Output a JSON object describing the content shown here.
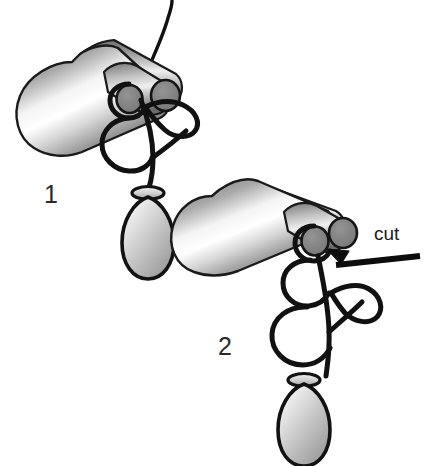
{
  "figure": {
    "background_color": "#ffffff",
    "width": 433,
    "height": 466,
    "panels": [
      {
        "id": "panel-1",
        "number_label": "1",
        "description": "Shaded cone-and-cylinder body with two circular disc ends, a free thread rising from the top, a tangled loop structure below, and a teardrop vesicle with a collar ring"
      },
      {
        "id": "panel-2",
        "number_label": "2",
        "description": "Same structure shown lower-right with the free thread removed; a thick pointer line with arrowhead marks the cut site"
      }
    ],
    "annotations": [
      {
        "id": "cut-annotation",
        "label": "cut",
        "pointer": "arrowhead pointing up-left toward the small circular disc of panel 2"
      }
    ],
    "caption_ghost": "",
    "colors": {
      "outline": "#111111",
      "body_light": "#f2f2f2",
      "body_mid": "#9a9a9a",
      "body_dark": "#4a4a4a",
      "disc_fill": "#7d7d7d",
      "vesicle_light": "#ededed",
      "vesicle_mid": "#b5b5b5",
      "collar_fill": "#cfcfcf",
      "text": "#1a1a1a"
    }
  }
}
